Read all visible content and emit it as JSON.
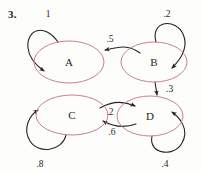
{
  "problem": {
    "number": "3."
  },
  "diagram": {
    "kind": "markov-chain-state-diagram",
    "node_stroke_color": "#c9808f",
    "edge_color": "#262220",
    "background_color": "#fdfdfc",
    "states": [
      {
        "id": "A",
        "label": "A",
        "cx": 69,
        "cy": 62,
        "rx": 35,
        "ry": 21
      },
      {
        "id": "B",
        "label": "B",
        "cx": 154,
        "cy": 62,
        "rx": 33,
        "ry": 20
      },
      {
        "id": "C",
        "label": "C",
        "cx": 72,
        "cy": 115,
        "rx": 36,
        "ry": 20
      },
      {
        "id": "D",
        "label": "D",
        "cx": 150,
        "cy": 116,
        "rx": 33,
        "ry": 20
      }
    ],
    "transitions": [
      {
        "id": "a-self",
        "from": "A",
        "to": "A",
        "label": "1",
        "type": "self-loop",
        "label_x": 48,
        "label_y": 17
      },
      {
        "id": "b-self",
        "from": "B",
        "to": "B",
        "label": ".2",
        "type": "self-loop",
        "label_x": 167,
        "label_y": 17
      },
      {
        "id": "b-to-a",
        "from": "B",
        "to": "A",
        "label": ".5",
        "type": "curve",
        "label_x": 110,
        "label_y": 42
      },
      {
        "id": "b-to-d",
        "from": "B",
        "to": "D",
        "label": ".3",
        "type": "straight",
        "label_x": 166,
        "label_y": 92
      },
      {
        "id": "c-to-d",
        "from": "C",
        "to": "D",
        "label": ".2",
        "type": "curve",
        "label_x": 110,
        "label_y": 113
      },
      {
        "id": "d-to-c",
        "from": "D",
        "to": "C",
        "label": ".6",
        "type": "curve",
        "label_x": 110,
        "label_y": 133
      },
      {
        "id": "c-self",
        "from": "C",
        "to": "C",
        "label": ".8",
        "type": "self-loop",
        "label_x": 40,
        "label_y": 167
      },
      {
        "id": "d-self",
        "from": "D",
        "to": "D",
        "label": ".4",
        "type": "self-loop",
        "label_x": 165,
        "label_y": 167
      }
    ]
  }
}
